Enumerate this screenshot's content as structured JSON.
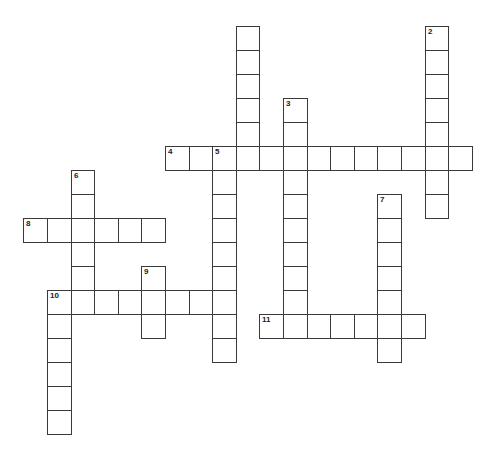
{
  "puzzle": {
    "type": "crossword",
    "grid": {
      "origin_x": 165,
      "origin_y": 146,
      "cell_w": 23.6,
      "cell_h": 24,
      "border_color": "#3a3a3a",
      "fill_color": "#ffffff"
    },
    "entries": [
      {
        "id": "unnumbered-down",
        "number": "",
        "direction": "down",
        "col": 3,
        "row": -5,
        "length": 6
      },
      {
        "id": "2-down",
        "number": "2",
        "direction": "down",
        "col": 11,
        "row": -5,
        "length": 8
      },
      {
        "id": "3-down",
        "number": "3",
        "direction": "down",
        "col": 5,
        "row": -2,
        "length": 10
      },
      {
        "id": "4-across",
        "number": "4",
        "direction": "across",
        "col": 0,
        "row": 0,
        "length": 13
      },
      {
        "id": "5-down",
        "number": "5",
        "direction": "down",
        "col": 2,
        "row": 0,
        "length": 9
      },
      {
        "id": "6-down",
        "number": "6",
        "direction": "down",
        "col": -4,
        "row": 1,
        "length": 6
      },
      {
        "id": "7-down",
        "number": "7",
        "direction": "down",
        "col": 9,
        "row": 2,
        "length": 7
      },
      {
        "id": "8-across",
        "number": "8",
        "direction": "across",
        "col": -6,
        "row": 3,
        "length": 6
      },
      {
        "id": "9-down",
        "number": "9",
        "direction": "down",
        "col": -1,
        "row": 5,
        "length": 3
      },
      {
        "id": "10-across",
        "number": "10",
        "direction": "across",
        "col": -5,
        "row": 6,
        "length": 8
      },
      {
        "id": "10-down",
        "number": "10",
        "direction": "down",
        "col": -5,
        "row": 6,
        "length": 6
      },
      {
        "id": "11-across",
        "number": "11",
        "direction": "across",
        "col": 4,
        "row": 7,
        "length": 7
      }
    ]
  }
}
